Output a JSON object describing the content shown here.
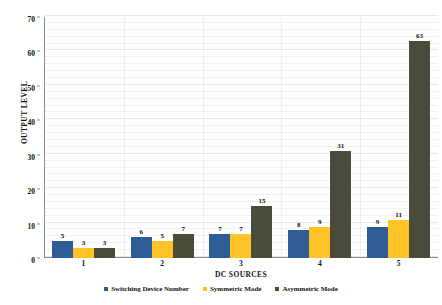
{
  "chart_data": {
    "type": "bar",
    "title": "",
    "subtitle": "",
    "xlabel": "DC SOURCES",
    "ylabel": "OUTPUT LEVEL",
    "categories": [
      "1",
      "2",
      "3",
      "4",
      "5"
    ],
    "ylim": [
      0,
      70
    ],
    "yticks": [
      0,
      10,
      20,
      30,
      40,
      50,
      60,
      70
    ],
    "ytick_labels": [
      "0",
      "10",
      "20",
      "30",
      "40",
      "50",
      "60",
      "70"
    ],
    "grid": true,
    "grid_minor_step": 2,
    "legend_position": "bottom",
    "series": [
      {
        "name": "Switching Device Number",
        "color": "#2E5C96",
        "values": [
          5,
          6,
          7,
          8,
          9
        ]
      },
      {
        "name": "Symmetric Mode",
        "color": "#FFC328",
        "values": [
          3,
          5,
          7,
          9,
          11
        ]
      },
      {
        "name": "Asymmetric Mode",
        "color": "#4B4B3C",
        "values": [
          3,
          7,
          15,
          31,
          63
        ]
      }
    ],
    "data_labels": true
  },
  "axes": {
    "y_title": "OUTPUT LEVEL",
    "x_title": "DC SOURCES"
  },
  "colors": {
    "series_1": "#2E5C96",
    "series_2": "#FFC328",
    "series_3": "#4B4B3C",
    "axis_line": "#8C8C8C",
    "gridline": "#F1F1F1",
    "background": "#FFFFFF",
    "text": "#111111"
  }
}
